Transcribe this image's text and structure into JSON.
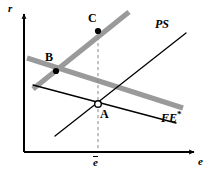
{
  "figure": {
    "background_color": "#ffffff",
    "width": 215,
    "height": 177
  },
  "axes": {
    "y_label": "r",
    "x_label": "e",
    "color": "#000000",
    "origin": {
      "x": 24,
      "y": 152
    },
    "y_top": {
      "x": 24,
      "y": 12
    },
    "x_right": {
      "x": 196,
      "y": 152
    }
  },
  "curves": [
    {
      "id": "ls-gray-rising",
      "label": "",
      "style": "thick-gray",
      "color": "#9a9a9a",
      "x1": 33,
      "y1": 89,
      "x2": 129,
      "y2": 12
    },
    {
      "id": "ls-gray-falling",
      "label": "",
      "style": "thick-gray",
      "color": "#9a9a9a",
      "x1": 27,
      "y1": 58,
      "x2": 183,
      "y2": 108
    },
    {
      "id": "ps-line",
      "label": "PS",
      "style": "thin-black",
      "color": "#000000",
      "x1": 55,
      "y1": 136,
      "x2": 186,
      "y2": 33
    },
    {
      "id": "fe-line",
      "label": "FE",
      "label_superscript": "*",
      "style": "thin-black",
      "color": "#000000",
      "x1": 33,
      "y1": 85,
      "x2": 176,
      "y2": 123
    }
  ],
  "guide_line": {
    "id": "ebar-dashed",
    "style": "dashed",
    "color": "#777777",
    "x": 98,
    "y_top": 31,
    "y_bottom": 152
  },
  "points": [
    {
      "id": "point-c",
      "label": "C",
      "marker": "filled",
      "x": 98,
      "y": 31,
      "label_x": 88,
      "label_y": 14
    },
    {
      "id": "point-b",
      "label": "B",
      "marker": "filled",
      "x": 56,
      "y": 71,
      "label_x": 45,
      "label_y": 53
    },
    {
      "id": "point-a",
      "label": "A",
      "marker": "open",
      "x": 98,
      "y": 104,
      "label_x": 100,
      "label_y": 110
    }
  ],
  "tick_labels": [
    {
      "id": "ebar-tick",
      "text": "e",
      "overbar": true,
      "x": 93,
      "y": 156
    }
  ],
  "curve_labels": [
    {
      "id": "ps-label",
      "text": "PS",
      "x": 155,
      "y": 22
    },
    {
      "id": "fe-label",
      "text": "FE",
      "superscript": "*",
      "x": 161,
      "y": 115
    }
  ],
  "axis_labels": [
    {
      "id": "r-label",
      "text": "r",
      "x": 9,
      "y": 5
    },
    {
      "id": "e-label",
      "text": "e",
      "x": 197,
      "y": 155
    }
  ]
}
